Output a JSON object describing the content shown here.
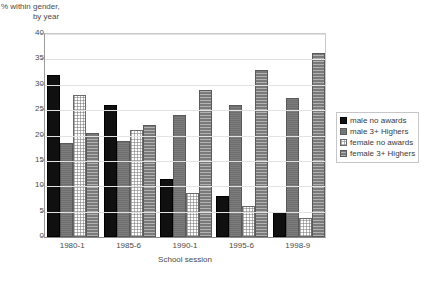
{
  "chart_data": {
    "type": "bar",
    "title": "",
    "ylabel": "% within gender, by year",
    "ylabel_line1": "% within gender,",
    "ylabel_line2": "by year",
    "xlabel": "School session",
    "categories": [
      "1980-1",
      "1985-6",
      "1990-1",
      "1995-6",
      "1998-9"
    ],
    "series": [
      {
        "name": "male no awards",
        "values": [
          32.0,
          26.0,
          11.5,
          8.0,
          5.0
        ]
      },
      {
        "name": "male 3+ Highers",
        "values": [
          18.5,
          19.0,
          24.0,
          26.0,
          27.3
        ]
      },
      {
        "name": "female no awards",
        "values": [
          28.0,
          21.0,
          8.7,
          6.2,
          3.8
        ]
      },
      {
        "name": "female 3+ Highers",
        "values": [
          20.5,
          22.0,
          29.0,
          33.0,
          36.3
        ]
      }
    ],
    "ylim": [
      0,
      40
    ],
    "yticks": [
      0,
      5,
      10,
      15,
      20,
      25,
      30,
      35,
      40
    ],
    "ytick_labels": [
      "0",
      "5",
      "10",
      "15",
      "20",
      "25",
      "30",
      "35",
      "40"
    ],
    "grid": true,
    "legend_position": "right",
    "legend_entries": [
      {
        "label": "male no awards",
        "swatch": "black-solid"
      },
      {
        "label": "male 3+ Highers",
        "swatch": "gray-solid"
      },
      {
        "label": "female no awards",
        "swatch": "white-dotted"
      },
      {
        "label": "female 3+ Highers",
        "swatch": "gray-hatched"
      }
    ],
    "colors": {
      "series0": "#101010",
      "series1": "#6e6e6e",
      "series2": "#ffffff",
      "series3": "#7a7a7a",
      "gridline": "#e2e2e2",
      "axis": "#8a8a8a",
      "text": "#4a4a4a",
      "background": "#ffffff"
    }
  }
}
